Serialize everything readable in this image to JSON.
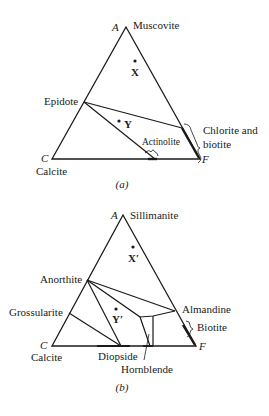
{
  "diagram_a": {
    "caption": "(a)",
    "vertices": {
      "top": {
        "letter": "A",
        "mineral": "Muscovite"
      },
      "left": {
        "letter": "C",
        "mineral": "Calcite"
      },
      "right": {
        "letter": "F"
      }
    },
    "points": [
      {
        "label": "X"
      },
      {
        "label": "Y"
      }
    ],
    "minerals": {
      "epidote": "Epidote",
      "actinolite": "Actinolite",
      "chlorite_line1": "Chlorite and",
      "chlorite_line2": "biotite"
    }
  },
  "diagram_b": {
    "caption": "(b)",
    "vertices": {
      "top": {
        "letter": "A",
        "mineral": "Sillimanite"
      },
      "left": {
        "letter": "C",
        "mineral": "Calcite"
      },
      "right": {
        "letter": "F"
      }
    },
    "points": [
      {
        "label": "X′"
      },
      {
        "label": "Y′"
      }
    ],
    "minerals": {
      "anorthite": "Anorthite",
      "grossularite": "Grossularite",
      "almandine": "Almandine",
      "biotite": "Biotite",
      "diopside": "Diopside",
      "hornblende": "Hornblende"
    }
  }
}
